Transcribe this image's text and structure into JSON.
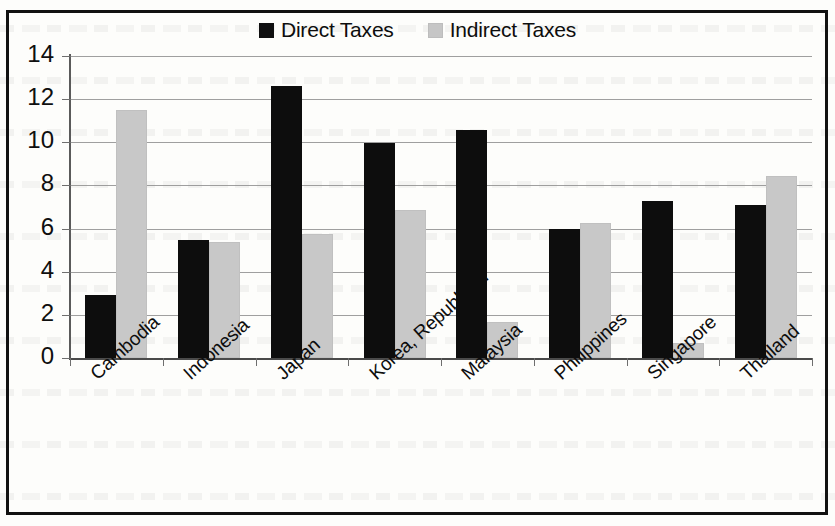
{
  "chart_data": {
    "type": "bar",
    "title": "",
    "subtitle": "",
    "xlabel": "",
    "ylabel": "",
    "ylim": [
      0,
      14
    ],
    "y_ticks": [
      0,
      2,
      4,
      6,
      8,
      10,
      12,
      14
    ],
    "grid": true,
    "legend_position": "top-center",
    "orientation": "vertical",
    "grouping": "grouped",
    "categories": [
      "Cambodia",
      "Indonesia",
      "Japan",
      "Korea, Republic of",
      "Malaysia",
      "Philippines",
      "Singapore",
      "Thailand"
    ],
    "series": [
      {
        "name": "Direct Taxes",
        "color": "#0d0d0d",
        "values": [
          2.9,
          5.45,
          12.6,
          9.95,
          10.55,
          6.0,
          7.3,
          7.1
        ]
      },
      {
        "name": "Indirect Taxes",
        "color": "#c8c8c8",
        "values": [
          11.5,
          5.4,
          5.75,
          6.85,
          1.65,
          6.25,
          0.7,
          8.45
        ]
      }
    ]
  },
  "legend": {
    "entries": [
      {
        "label": "Direct Taxes",
        "swatch": "black-square-icon"
      },
      {
        "label": "Indirect Taxes",
        "swatch": "gray-square-icon"
      }
    ]
  },
  "axes": {
    "y_tick_labels": [
      "14",
      "12",
      "10",
      "8",
      "6",
      "4",
      "2",
      "0"
    ],
    "x_tick_labels": [
      "Cambodia",
      "Indonesia",
      "Japan",
      "Korea, Republic of",
      "Malaysia",
      "Philippines",
      "Singapore",
      "Thailand"
    ]
  },
  "colors": {
    "direct": "#0d0d0d",
    "indirect": "#c8c8c8",
    "gridline": "#8e8e8e",
    "axis": "#4a4a4a",
    "border": "#111111",
    "background": "#fdfdfb"
  }
}
